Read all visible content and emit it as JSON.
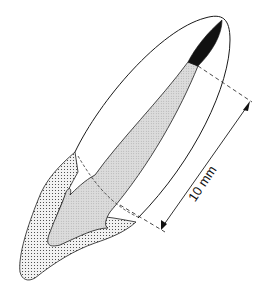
{
  "figure": {
    "measurement_label": "10 mm",
    "colors": {
      "outline": "#1a1a1a",
      "canal_fill": "#d4d4d4",
      "crown_stipple": "#e6e6e6",
      "apex_fill": "#111111",
      "background": "#ffffff"
    }
  }
}
